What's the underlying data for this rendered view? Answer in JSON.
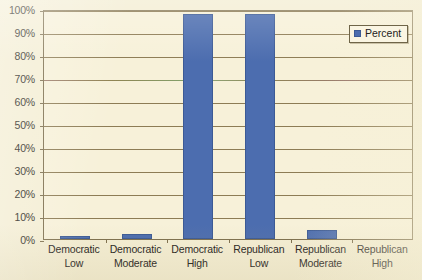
{
  "chart_data": {
    "type": "bar",
    "title": "",
    "xlabel": "",
    "ylabel": "",
    "categories": [
      "Democratic Low",
      "Democratic Moderate",
      "Democratic High",
      "Republican Low",
      "Republican Moderate",
      "Republican High"
    ],
    "category_lines": [
      [
        "Democratic",
        "Low"
      ],
      [
        "Democratic",
        "Moderate"
      ],
      [
        "Democratic",
        "High"
      ],
      [
        "Republican",
        "Low"
      ],
      [
        "Republican",
        "Moderate"
      ],
      [
        "Republican",
        "High"
      ]
    ],
    "series": [
      {
        "name": "Percent",
        "values": [
          1,
          2,
          98,
          98,
          4,
          0
        ],
        "color": "#4C6DAF"
      }
    ],
    "ylim": [
      0,
      100
    ],
    "ytick_values": [
      0,
      10,
      20,
      30,
      40,
      50,
      60,
      70,
      80,
      90,
      100
    ],
    "ytick_labels": [
      "0%",
      "10%",
      "20%",
      "30%",
      "40%",
      "50%",
      "60%",
      "70%",
      "80%",
      "90%",
      "100%"
    ],
    "grid": "horizontal",
    "legend_position": "top-right"
  },
  "legend": {
    "label": "Percent",
    "swatch_name": "percent-series-swatch"
  },
  "colors": {
    "bar": "#4C6DAF",
    "bar_border": "#3C5A95",
    "plot_background": "#F7F1D9",
    "page_background": "#F4EED4",
    "axis": "#7D6F4E",
    "gridline": "#8D7C55",
    "text": "#24221C"
  }
}
